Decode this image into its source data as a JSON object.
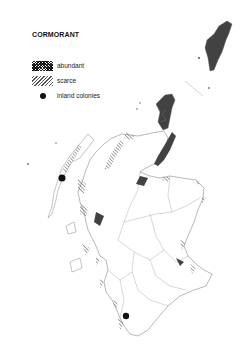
{
  "map": {
    "title": "CORMORANT",
    "region": "Scotland",
    "legend": [
      {
        "key": "abundant",
        "label": "abundant",
        "symbol": "cross-hatch"
      },
      {
        "key": "scarce",
        "label": "scarce",
        "symbol": "diagonal-hatch"
      },
      {
        "key": "inland",
        "label": "inland colonies",
        "symbol": "filled-dot"
      }
    ],
    "colors": {
      "ink": "#111111",
      "outline": "#888888",
      "background": "#ffffff"
    }
  }
}
